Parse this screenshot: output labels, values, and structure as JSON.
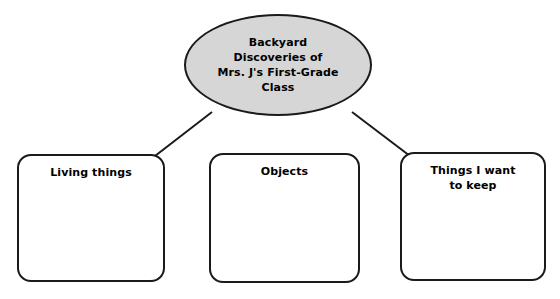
{
  "diagram": {
    "type": "concept-web",
    "center": {
      "shape": "ellipse",
      "fill_color": "#d6d6d6",
      "border_color": "#1a1a1a",
      "lines": [
        "Backyard",
        "Discoveries of",
        "Mrs. J's First-Grade",
        "Class"
      ]
    },
    "branches": [
      {
        "id": "living-things",
        "shape": "rounded-rectangle",
        "fill_color": "#ffffff",
        "border_color": "#1a1a1a",
        "lines": [
          "Living things"
        ],
        "connected_to_center": true
      },
      {
        "id": "objects",
        "shape": "rounded-rectangle",
        "fill_color": "#ffffff",
        "border_color": "#1a1a1a",
        "lines": [
          "Objects"
        ],
        "connected_to_center": false
      },
      {
        "id": "things-i-want-to-keep",
        "shape": "rounded-rectangle",
        "fill_color": "#ffffff",
        "border_color": "#1a1a1a",
        "lines": [
          "Things I want",
          "to keep"
        ],
        "connected_to_center": true
      }
    ]
  }
}
